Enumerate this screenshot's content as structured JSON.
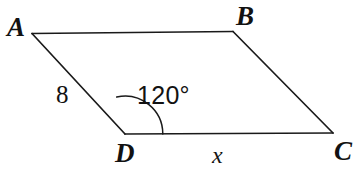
{
  "figure": {
    "kind": "parallelogram-diagram",
    "background_color": "#ffffff",
    "stroke_color": "#1a1a1a",
    "stroke_width": 1.6,
    "vertices": {
      "A": {
        "label": "A",
        "x": 32,
        "y": 33
      },
      "B": {
        "label": "B",
        "x": 233,
        "y": 31
      },
      "C": {
        "label": "C",
        "x": 333,
        "y": 133
      },
      "D": {
        "label": "D",
        "x": 125,
        "y": 134
      }
    },
    "edges": [
      {
        "name": "AB",
        "from": "A",
        "to": "B"
      },
      {
        "name": "BC",
        "from": "B",
        "to": "C"
      },
      {
        "name": "CD",
        "from": "C",
        "to": "D"
      },
      {
        "name": "DA",
        "from": "D",
        "to": "A"
      }
    ],
    "side_labels": {
      "ad": "8",
      "dc": "x"
    },
    "angle": {
      "at_vertex": "D",
      "value": "120°",
      "arc_radius": 40
    }
  }
}
